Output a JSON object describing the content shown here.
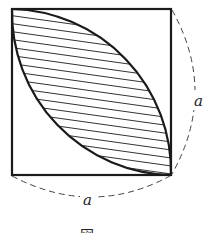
{
  "figure": {
    "side_label_right": "a",
    "side_label_bottom": "a",
    "caption": "図",
    "colors": {
      "stroke": "#1a1a1a",
      "hatch": "#333333",
      "background": "#ffffff"
    }
  }
}
